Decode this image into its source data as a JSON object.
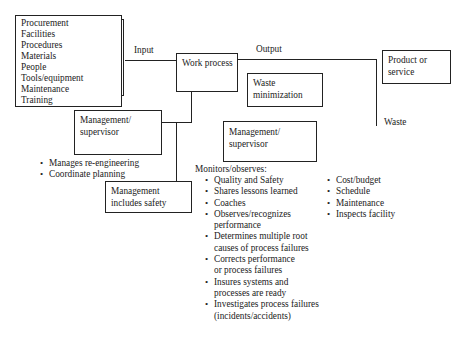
{
  "inputs_box": {
    "items": [
      "Procurement",
      "Facilities",
      "Procedures",
      "Materials",
      "People",
      "Tools/equipment",
      "Maintenance",
      "Training"
    ]
  },
  "labels": {
    "input": "Input",
    "output": "Output",
    "waste": "Waste",
    "monitors_heading": "Monitors/observes:"
  },
  "work_process": {
    "label": "Work process"
  },
  "product_box": {
    "line1": "Product or",
    "line2": "service"
  },
  "waste_min_box": {
    "line1": "Waste",
    "line2": "minimization"
  },
  "mgmt_left_box": {
    "line1": "Management/",
    "line2": "supervisor"
  },
  "mgmt_right_box": {
    "line1": "Management/",
    "line2": "supervisor"
  },
  "mgmt_safety_box": {
    "line1": "Management",
    "line2": "includes safety"
  },
  "left_bullets": [
    "Manages re-engineering",
    "Coordinate planning"
  ],
  "monitors_bullets": [
    [
      "Quality and Safety"
    ],
    [
      "Shares lessons learned"
    ],
    [
      "Coaches"
    ],
    [
      "Observes/recognizes",
      "performance"
    ],
    [
      "Determines multiple root",
      "causes of process failures"
    ],
    [
      "Corrects performance",
      "or process failures"
    ],
    [
      "Insures systems and",
      "processes are ready"
    ],
    [
      "Investigates process failures",
      "(incidents/accidents)"
    ]
  ],
  "right_bullets": [
    "Cost/budget",
    "Schedule",
    "Maintenance",
    "Inspects facility"
  ]
}
